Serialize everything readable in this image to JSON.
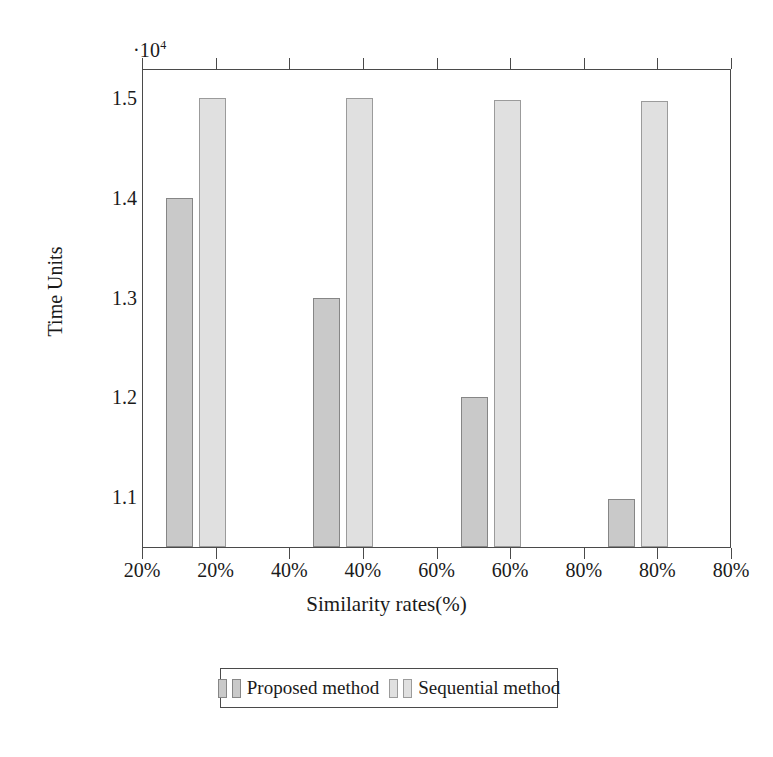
{
  "chart_data": {
    "type": "bar",
    "title": "",
    "xlabel": "Similarity rates(%)",
    "ylabel": "Time Units",
    "y_exponent_label": "·10",
    "y_exponent_power": "4",
    "y_tick_labels": [
      "1.1",
      "1.2",
      "1.3",
      "1.4",
      "1.5"
    ],
    "y_tick_values": [
      11000,
      12000,
      13000,
      14000,
      15000
    ],
    "ylim": [
      10500,
      15300
    ],
    "x_tick_labels": [
      "20%",
      "20%",
      "40%",
      "40%",
      "60%",
      "60%",
      "80%",
      "80%",
      "80%"
    ],
    "categories": [
      "20%",
      "40%",
      "60%",
      "80%"
    ],
    "grid": false,
    "legend_position": "below-center",
    "series": [
      {
        "name": "Proposed method",
        "color": "#c9c9c9",
        "border_color": "#868686",
        "values": [
          14000,
          13000,
          12000,
          10980
        ]
      },
      {
        "name": "Sequential method",
        "color": "#e0e0e0",
        "border_color": "#9b9b9b",
        "values": [
          15000,
          15000,
          14975,
          14970
        ]
      }
    ]
  },
  "axes": {
    "y_title": "Time Units",
    "x_title": "Similarity rates(%)",
    "exponent": "·10",
    "exponent_sup": "4",
    "y_ticks": [
      {
        "label": "1.5",
        "value": 15000
      },
      {
        "label": "1.4",
        "value": 14000
      },
      {
        "label": "1.3",
        "value": 13000
      },
      {
        "label": "1.2",
        "value": 12000
      },
      {
        "label": "1.1",
        "value": 11000
      }
    ],
    "x_ticks": [
      {
        "label": "20%"
      },
      {
        "label": "20%"
      },
      {
        "label": "40%"
      },
      {
        "label": "40%"
      },
      {
        "label": "60%"
      },
      {
        "label": "60%"
      },
      {
        "label": "80%"
      },
      {
        "label": "80%"
      },
      {
        "label": "80%"
      }
    ]
  },
  "legend": {
    "entries": [
      {
        "label": "Proposed method",
        "color": "#c9c9c9"
      },
      {
        "label": "Sequential method",
        "color": "#e0e0e0"
      }
    ]
  },
  "colors": {
    "series_proposed": "#c9c9c9",
    "series_sequential": "#e0e0e0",
    "axis": "#4a4a4a",
    "background": "#ffffff",
    "text": "#1a1a1a"
  }
}
